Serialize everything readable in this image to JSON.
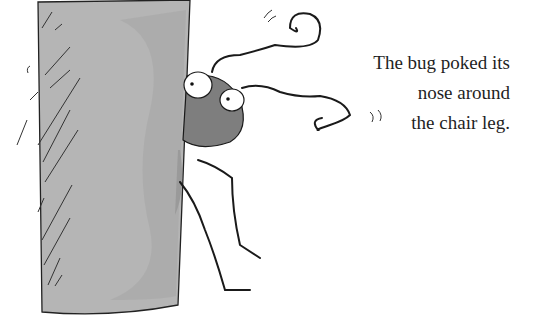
{
  "caption": {
    "lines": [
      "The bug poked its",
      "nose around",
      "the chair leg."
    ]
  },
  "illustration": {
    "subjects": [
      "chair-leg",
      "bug"
    ],
    "colors": {
      "chair_leg": "#b4b4b4",
      "chair_leg_shadow": "#a2a2a2",
      "bug_body": "#7e7e7e",
      "ink": "#1a1a1a",
      "background": "#ffffff"
    }
  }
}
